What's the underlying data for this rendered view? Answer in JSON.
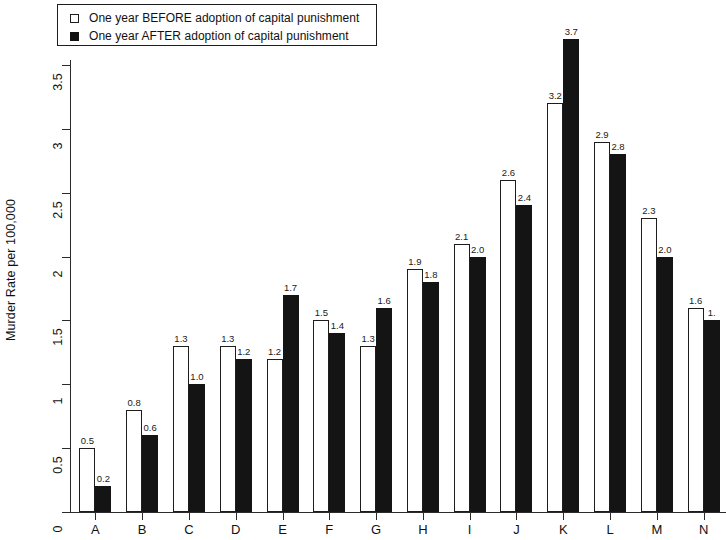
{
  "chart_data": {
    "type": "bar",
    "title": "",
    "xlabel": "",
    "ylabel": "Murder Rate per 100,000",
    "ylim": [
      0,
      3.5
    ],
    "ytick_labels": [
      "0",
      "0.5",
      "1",
      "1.5",
      "2",
      "2.5",
      "3",
      "3.5"
    ],
    "ytick_values": [
      0,
      0.5,
      1,
      1.5,
      2,
      2.5,
      3,
      3.5
    ],
    "grid": false,
    "legend_position": "top-left",
    "categories": [
      "A",
      "B",
      "C",
      "D",
      "E",
      "F",
      "G",
      "H",
      "I",
      "J",
      "K",
      "L",
      "M",
      "N"
    ],
    "series": [
      {
        "name": "One year BEFORE adoption of capital punishment",
        "style": "open",
        "color": "#ffffff",
        "edge_color": "#1d1d1d",
        "values": [
          0.5,
          0.8,
          1.3,
          1.3,
          1.2,
          1.5,
          1.3,
          1.9,
          2.1,
          2.6,
          3.2,
          2.9,
          2.3,
          1.6
        ],
        "value_labels": [
          "0.5",
          "0.8",
          "1.3",
          "1.3",
          "1.2",
          "1.5",
          "1.3",
          "1.9",
          "2.1",
          "2.6",
          "3.2",
          "2.9",
          "2.3",
          "1.6"
        ]
      },
      {
        "name": "One year AFTER adoption of capital punishment",
        "style": "filled",
        "color": "#141414",
        "edge_color": "#141414",
        "values": [
          0.2,
          0.6,
          1.0,
          1.2,
          1.7,
          1.4,
          1.6,
          1.8,
          2.0,
          2.4,
          3.7,
          2.8,
          2.0,
          1.5
        ],
        "value_labels": [
          "0.2",
          "0.6",
          "1.0",
          "1.2",
          "1.7",
          "1.4",
          "1.6",
          "1.8",
          "2.0",
          "2.4",
          "3.7",
          "2.8",
          "2.0",
          "1."
        ]
      }
    ]
  },
  "legend": {
    "items": [
      {
        "label": "One year BEFORE adoption of capital punishment",
        "swatch": "open-square-icon"
      },
      {
        "label": "One year AFTER adoption of capital punishment",
        "swatch": "filled-square-icon"
      }
    ]
  },
  "axes": {
    "y_title": "Murder Rate per 100,000"
  }
}
